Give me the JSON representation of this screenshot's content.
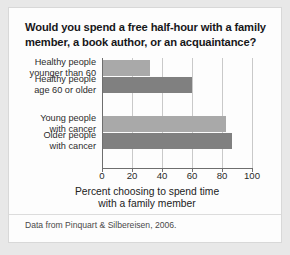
{
  "card": {
    "title": "Would you spend a free half-hour with a family member, a book author, or an acquaintance?",
    "source_note": "Data from Pinquart & Silbereisen, 2006.",
    "background_color": "#fdfdfd",
    "page_background_color": "#e8e8e8"
  },
  "chart_data": {
    "type": "bar",
    "orientation": "horizontal",
    "title": "Would you spend a free half-hour with a family member, a book author, or an acquaintance?",
    "categories": [
      "Healthy people younger than 60",
      "Healthy people age 60 or older",
      "Young people with cancer",
      "Older people with cancer"
    ],
    "category_lines": [
      [
        "Healthy people",
        "younger than 60"
      ],
      [
        "Healthy people",
        "age 60 or older"
      ],
      [
        "Young people",
        "with cancer"
      ],
      [
        "Older people",
        "with cancer"
      ]
    ],
    "values": [
      31,
      59,
      82,
      86
    ],
    "bar_colors": [
      "#a9a9a9",
      "#808080",
      "#a9a9a9",
      "#808080"
    ],
    "xlabel": "Percent choosing to spend time with a family member",
    "xlabel_lines": [
      "Percent choosing to spend time",
      "with a family member"
    ],
    "ylabel": "",
    "xlim": [
      0,
      100
    ],
    "xticks": [
      0,
      20,
      40,
      60,
      80,
      100
    ],
    "xtick_labels": [
      "0",
      "20",
      "40",
      "60",
      "80",
      "100"
    ],
    "grid": "vertical",
    "gridline_color": "#c9c9c9",
    "axis_color": "#6e6e6e",
    "legend": "none"
  }
}
